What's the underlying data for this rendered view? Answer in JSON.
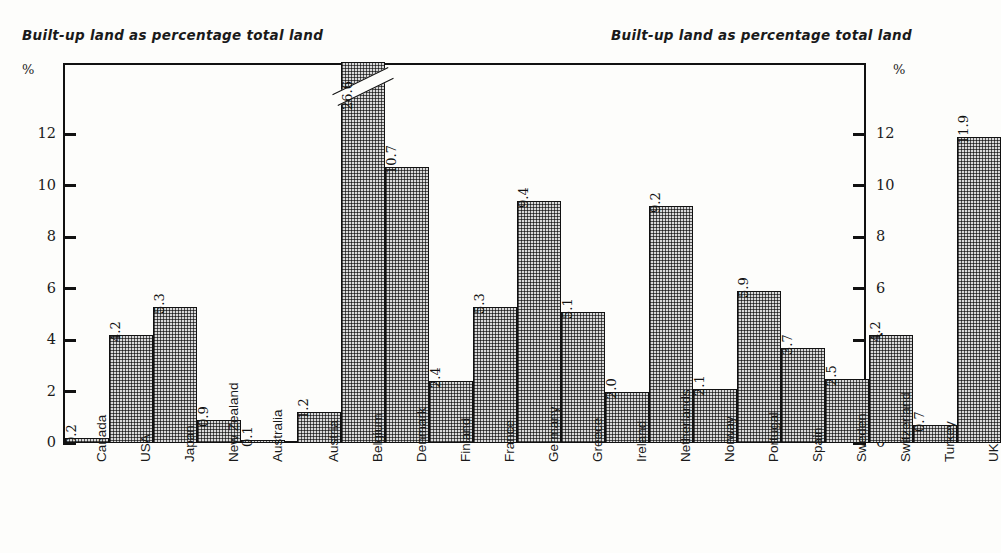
{
  "chart": {
    "title_left": "Built-up land as percentage total land",
    "title_right": "Built-up land as percentage total land",
    "unit_left": "%",
    "unit_right": "%"
  },
  "chart_data": {
    "type": "bar",
    "title": "Built-up land as percentage total land",
    "xlabel": "",
    "ylabel": "%",
    "ylim": [
      0,
      13.5
    ],
    "yticks": [
      0,
      2,
      4,
      6,
      8,
      10,
      12
    ],
    "ytick_labels": [
      "0",
      "2",
      "4",
      "6",
      "8",
      "10",
      "12"
    ],
    "grid": false,
    "legend": "none",
    "axis_break": {
      "category": "Belgium",
      "value": 26.6,
      "note": "bar truncated above axis maximum, drawn with diagonal break mark"
    },
    "groups": [
      {
        "name": "group-1",
        "categories": [
          "Canada",
          "USA",
          "Japan",
          "New Zealand",
          "Australia"
        ],
        "values": [
          0.2,
          4.2,
          5.3,
          0.9,
          0.1
        ]
      },
      {
        "name": "group-2",
        "categories": [
          "Austria",
          "Belgium",
          "Denmark",
          "Finland",
          "France",
          "Germany",
          "Greece",
          "Ireland",
          "Netherlands",
          "Norway",
          "Portugal",
          "Spain",
          "Sweden",
          "Switzerland",
          "Turkey",
          "UK"
        ],
        "values": [
          1.2,
          26.6,
          10.7,
          2.4,
          5.3,
          9.4,
          5.1,
          2.0,
          9.2,
          2.1,
          5.9,
          3.7,
          2.5,
          4.2,
          0.7,
          11.9
        ]
      }
    ],
    "categories": [
      "Canada",
      "USA",
      "Japan",
      "New Zealand",
      "Australia",
      "Austria",
      "Belgium",
      "Denmark",
      "Finland",
      "France",
      "Germany",
      "Greece",
      "Ireland",
      "Netherlands",
      "Norway",
      "Portugal",
      "Spain",
      "Sweden",
      "Switzerland",
      "Turkey",
      "UK"
    ],
    "values": [
      0.2,
      4.2,
      5.3,
      0.9,
      0.1,
      1.2,
      26.6,
      10.7,
      2.4,
      5.3,
      9.4,
      5.1,
      2.0,
      9.2,
      2.1,
      5.9,
      3.7,
      2.5,
      4.2,
      0.7,
      11.9
    ],
    "value_labels": [
      "0.2",
      "4.2",
      "5.3",
      "0.9",
      "0.1",
      "1.2",
      "26.6",
      "10.7",
      "2.4",
      "5.3",
      "9.4",
      "5.1",
      "2.0",
      "9.2",
      "2.1",
      "5.9",
      "3.7",
      "2.5",
      "4.2",
      "0.7",
      "11.9"
    ]
  }
}
